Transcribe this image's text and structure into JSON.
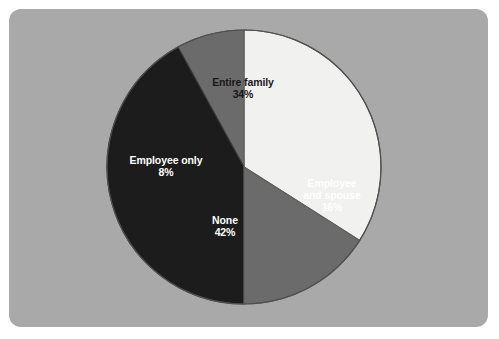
{
  "figure": {
    "background_color": "#ffffff",
    "panel_color": "#a9a9a9"
  },
  "chart_data": {
    "type": "pie",
    "title": "",
    "subtitle": "",
    "xlabel": "",
    "ylabel": "",
    "legend_position": "none",
    "grid": false,
    "labels_inside_slices": true,
    "start_angle_deg": 0,
    "direction": "clockwise",
    "categories": [
      "Entire family",
      "Employee and spouse",
      "None",
      "Employee only"
    ],
    "values": [
      34,
      16,
      42,
      8
    ],
    "value_suffix": "%",
    "colors": [
      "#f1f1ef",
      "#6b6b6b",
      "#1c1c1c",
      "#6b6b6b"
    ],
    "label_text_colors": [
      "#18181a",
      "#ffffff",
      "#ffffff",
      "#ffffff"
    ],
    "slices": [
      {
        "name": "Entire family",
        "value": 34,
        "value_label": "34%",
        "color": "#f1f1ef",
        "text_color": "#18181a",
        "start_deg": 0,
        "end_deg": 122.4,
        "name_line_1": "Entire family",
        "name_line_2": ""
      },
      {
        "name": "Employee and spouse",
        "value": 16,
        "value_label": "16%",
        "color": "#6b6b6b",
        "text_color": "#ffffff",
        "start_deg": 122.4,
        "end_deg": 180.0,
        "name_line_1": "Employee",
        "name_line_2": "and spouse"
      },
      {
        "name": "None",
        "value": 42,
        "value_label": "42%",
        "color": "#1c1c1c",
        "text_color": "#ffffff",
        "start_deg": 180.0,
        "end_deg": 331.2,
        "name_line_1": "None",
        "name_line_2": ""
      },
      {
        "name": "Employee only",
        "value": 8,
        "value_label": "8%",
        "color": "#6b6b6b",
        "text_color": "#ffffff",
        "start_deg": 331.2,
        "end_deg": 360.0,
        "name_line_1": "Employee only",
        "name_line_2": ""
      }
    ],
    "total": 100,
    "geometry": {
      "center_x": 244,
      "center_y": 167,
      "radius": 137
    }
  }
}
